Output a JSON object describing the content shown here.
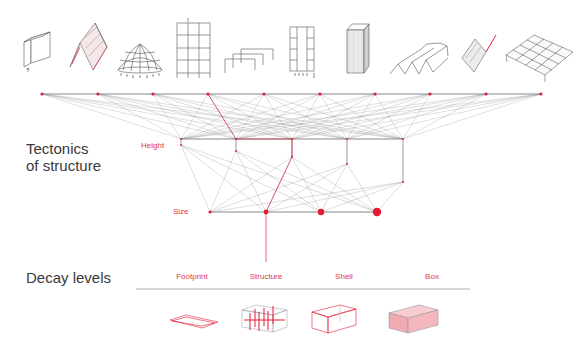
{
  "colors": {
    "accent": "#e31b36",
    "line": "#8a8f8f",
    "line_light": "#b5b9b9",
    "text": "#3a3a3a",
    "label": "#e0364a",
    "box_fill": "#f4b7bd"
  },
  "sections": {
    "tectonics_title_line1": "Tectonics",
    "tectonics_title_line2": "of structure",
    "decay_title": "Decay levels"
  },
  "axes": {
    "height_label": "Height",
    "size_label": "Size"
  },
  "structure_icons": [
    {
      "name": "wall-slab-icon"
    },
    {
      "name": "folded-plate-icon"
    },
    {
      "name": "dome-icon"
    },
    {
      "name": "frame-grid-icon"
    },
    {
      "name": "portal-frames-icon"
    },
    {
      "name": "core-tube-frame-icon"
    },
    {
      "name": "shell-tube-icon"
    },
    {
      "name": "folded-roof-icon"
    },
    {
      "name": "inclined-plate-icon"
    },
    {
      "name": "space-frame-icon"
    }
  ],
  "decay_levels": [
    {
      "label": "Footprint",
      "icon": "footprint-icon"
    },
    {
      "label": "Structure",
      "icon": "structure-icon"
    },
    {
      "label": "Shell",
      "icon": "shell-icon"
    },
    {
      "label": "Box",
      "icon": "box-icon"
    }
  ],
  "network": {
    "top_nodes_x": [
      42,
      98,
      153,
      208,
      264,
      320,
      375,
      430,
      486,
      541
    ],
    "top_y": 94,
    "height_nodes_x": [
      181,
      236,
      292,
      347,
      403
    ],
    "height_y": 139,
    "height_sub_y": [
      145,
      151,
      157,
      164,
      182
    ],
    "size_nodes_x": [
      210,
      266,
      321,
      377
    ],
    "size_y": 212,
    "size_radii": [
      1.6,
      2.4,
      3.2,
      4.2
    ],
    "highlight_path": "208,94 236,139 292,139 292,157 266,212 266,262"
  }
}
